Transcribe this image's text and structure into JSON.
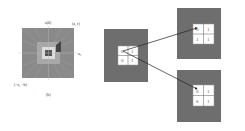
{
  "left_figure": {
    "top_label": "a(0)",
    "top_right_label": "(a, r)",
    "right_label": "a₀",
    "bottom_left_label": "(−a, −b)",
    "caption": "(b)",
    "colors": {
      "outer": "#8a8a8a",
      "middle": "#a8a8a8",
      "inner_ring": "#d8d8d8",
      "center": "#555555",
      "accent_patch": "#444444"
    }
  },
  "source_patch": {
    "cells": [
      "0",
      "1",
      "0",
      "1"
    ],
    "colors": {
      "background": "#6e6e6e",
      "grid": "#ffffff"
    }
  },
  "target_patches": [
    {
      "cells": [
        "0",
        "1",
        "1",
        "1"
      ]
    },
    {
      "cells": [
        "0",
        "1",
        "0",
        "1"
      ]
    }
  ],
  "arrow_color": "#222222"
}
